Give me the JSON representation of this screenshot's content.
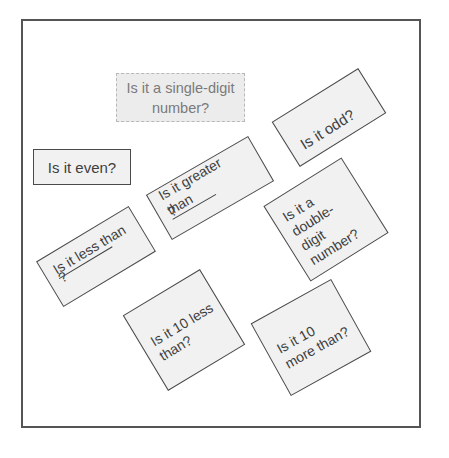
{
  "diagram": {
    "frame": {
      "border_color": "#555555"
    },
    "cards": [
      {
        "id": "single-digit",
        "line1": "Is it a single-digit",
        "line2": "number?"
      },
      {
        "id": "even",
        "text": "Is it even?"
      },
      {
        "id": "odd",
        "text": "Is it odd?"
      },
      {
        "id": "greater",
        "line1": "Is it greater",
        "line2": "than",
        "suffix": "?"
      },
      {
        "id": "double-digit",
        "lines": [
          "Is it a",
          "double-",
          "digit",
          "number?"
        ]
      },
      {
        "id": "less",
        "line1": "Is it less than",
        "suffix": "?"
      },
      {
        "id": "ten-less",
        "line1": "Is it 10 less",
        "line2": "than?"
      },
      {
        "id": "ten-more",
        "line1": "Is it 10",
        "line2": "more than?"
      }
    ]
  }
}
